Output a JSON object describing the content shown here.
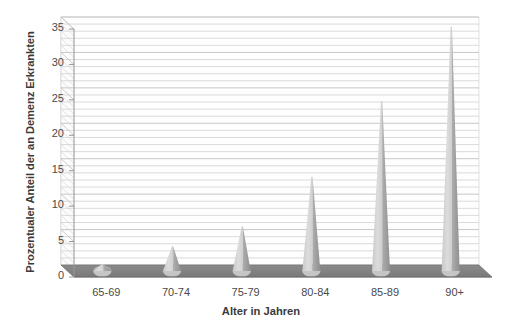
{
  "chart_data": {
    "type": "bar",
    "title": "",
    "subtitle": "",
    "xlabel": "Alter in Jahren",
    "ylabel": "Prozentualer Anteil der an Demenz Erkrankten",
    "categories": [
      "65-69",
      "70-74",
      "75-79",
      "80-84",
      "85-89",
      "90+"
    ],
    "values": [
      1.0,
      3.5,
      6.3,
      13.3,
      24.0,
      34.5
    ],
    "series": [
      {
        "name": "Prozentualer Anteil der an Demenz Erkrankten",
        "values": [
          1.0,
          3.5,
          6.3,
          13.3,
          24.0,
          34.5
        ]
      }
    ],
    "ylim": [
      0,
      35
    ],
    "yticks": [
      0,
      5,
      10,
      15,
      20,
      25,
      30,
      35
    ],
    "ytick_labels": [
      "0",
      "5",
      "10",
      "15",
      "20",
      "25",
      "30",
      "35"
    ],
    "minor_gridline_step": 1,
    "grid": true,
    "grid_axis": "y",
    "legend": false,
    "legend_position": "none",
    "style": "3d-cone",
    "colors": {
      "bar_fill": "#d2d2d2",
      "bar_shade": "#9d9d9d",
      "floor": "#7f7f7f",
      "wall": "#fdfdfd",
      "gridline": "#c8c8c8",
      "major_gridline": "#bdbdbd",
      "axis_text": "#4a4a4a",
      "title_text": "#3a3a3a",
      "background": "#ffffff"
    }
  }
}
